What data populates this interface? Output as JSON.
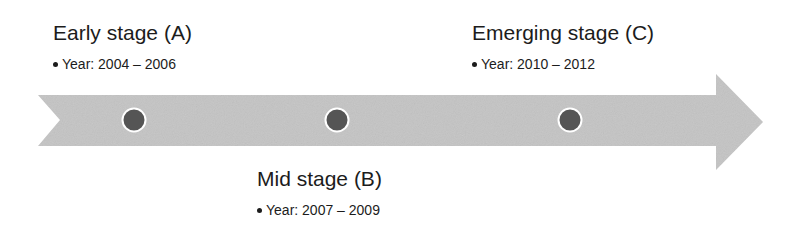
{
  "colors": {
    "arrow_fill": "#c4c4c4",
    "marker_fill": "#555555",
    "marker_ring": "#ffffff",
    "text": "#1c1c1c"
  },
  "timeline": {
    "shape": "notched-right-arrow",
    "markers": [
      {
        "id": "A",
        "cx": 134,
        "cy": 120
      },
      {
        "id": "B",
        "cx": 337,
        "cy": 120
      },
      {
        "id": "C",
        "cx": 570,
        "cy": 120
      }
    ]
  },
  "stages": {
    "a": {
      "title": "Early stage (A)",
      "bullet": "Year: 2004 – 2006",
      "position": "above"
    },
    "b": {
      "title": "Mid stage (B)",
      "bullet": "Year: 2007 – 2009",
      "position": "below"
    },
    "c": {
      "title": "Emerging stage (C)",
      "bullet": "Year: 2010 – 2012",
      "position": "above"
    }
  }
}
